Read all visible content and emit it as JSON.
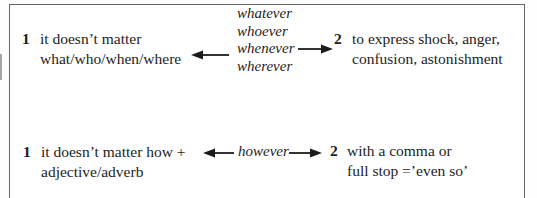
{
  "panel": {
    "background": "#ffffff",
    "border_color": "#646464",
    "text_color": "#1d1d1d"
  },
  "icons": {
    "left_arrow": "left-arrow",
    "right_arrow": "right-arrow"
  },
  "rows": [
    {
      "left": {
        "number": "1",
        "lines": [
          "it doesn’t matter",
          "what/who/when/where"
        ]
      },
      "center": {
        "words": [
          "whatever",
          "whoever",
          "whenever",
          "wherever"
        ]
      },
      "right": {
        "number": "2",
        "lines": [
          "to express shock, anger,",
          "confusion, astonishment"
        ]
      }
    },
    {
      "left": {
        "number": "1",
        "lines": [
          "it doesn’t matter how +",
          "adjective/adverb"
        ]
      },
      "center": {
        "words": [
          "however"
        ]
      },
      "right": {
        "number": "2",
        "lines": [
          "with a comma or",
          "full stop =’even so’"
        ]
      }
    }
  ]
}
